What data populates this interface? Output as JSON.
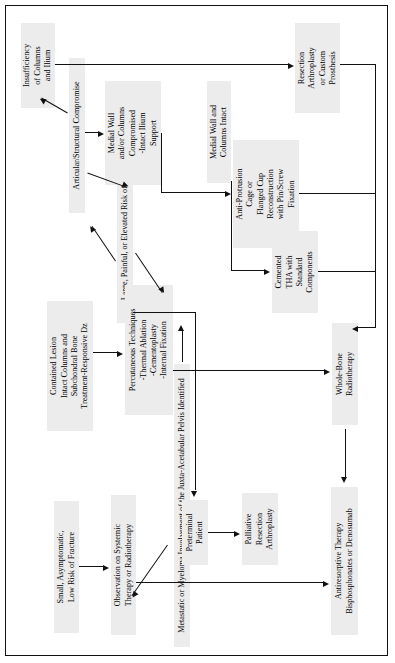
{
  "diagram": {
    "type": "flowchart",
    "orientation": "rotated-90-ccw",
    "node_fill": "#ececed",
    "line_color": "#111111",
    "border_color": "#111111",
    "nodes": {
      "root": "Metastatic or Myeloma Involvement of the Juxta-Acetabular Pelvis Identified",
      "large_painful": "Large, Painful, or Elevated Risk of Fracture",
      "articular_compromise": "Articular/Structural Compromise",
      "insufficiency": "Insufficiency\nof Columns\nand Ilium",
      "medial_wall_compromised": "Medial Wall\nand/or Columns\nCompromised\n-Intact Ilium\nSupport",
      "medial_wall_intact": "Medial Wall and\nColumns Intact",
      "resection_arthroplasty": "Resection\nArthroplasty\nor Custom\nProsthesis",
      "anti_protrusion": "Anti-Protrusion\nCage or\nFlanged Cup\nReconstruction\nwith Pin/Screw\nFixation",
      "cemented_tha": "Cemented\nTHA with\nStandard\nComponents",
      "contained_lesion": "Contained Lesion\nIntact Columns and\nSubchondral Bone\nTreatment-Responsive Dz",
      "percutaneous": "Percutaneous Techniques\n-Thermal Ablation\n-Cementoplasty\n-Internal Fixation",
      "preterminal": "Preterminal\nPatient",
      "palliative": "Palliative\nResection\nArthroplasty",
      "whole_bone_rt": "Whole-Bone\nRadiotherapy",
      "small_asymptomatic": "Small, Asymptomatic,\nLow Risk of Fracture",
      "observation": "Observation on Systemic\nTherapy or Radiotherapy",
      "antiresorptive": "Antiresorptive Therapy\nBisphosphonates or Denosumab"
    }
  }
}
